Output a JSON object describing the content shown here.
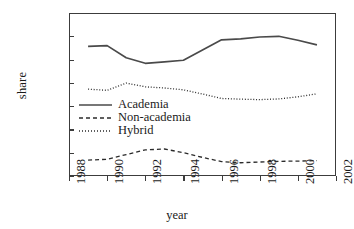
{
  "chart_data": {
    "type": "line",
    "title": "",
    "xlabel": "year",
    "ylabel": "share",
    "xlim": [
      1988,
      2002
    ],
    "ylim": [
      0.0,
      0.7
    ],
    "grid": false,
    "legend_position": "inside-left",
    "xticks": [
      "1988",
      "1990",
      "1992",
      "1994",
      "1996",
      "1998",
      "2000",
      "2002"
    ],
    "xtick_values": [
      1988,
      1990,
      1992,
      1994,
      1996,
      1998,
      2000,
      2002
    ],
    "yticks": [
      "0.000",
      "0.100",
      "0.200",
      "0.300",
      "0.400",
      "0.500",
      "0.600",
      "0.700"
    ],
    "ytick_values": [
      0.0,
      0.1,
      0.2,
      0.3,
      0.4,
      0.5,
      0.6,
      0.7
    ],
    "x": [
      1989,
      1990,
      1991,
      1992,
      1993,
      1994,
      1995,
      1996,
      1997,
      1998,
      1999,
      2000,
      2001
    ],
    "series": [
      {
        "name": "Academia",
        "style": "solid",
        "color": "#4a4a4a",
        "values": [
          0.557,
          0.56,
          0.508,
          0.484,
          0.49,
          0.497,
          0.541,
          0.585,
          0.589,
          0.597,
          0.6,
          0.583,
          0.563
        ]
      },
      {
        "name": "Non-academia",
        "style": "dashed",
        "color": "#2b2b2b",
        "values": [
          0.068,
          0.072,
          0.092,
          0.112,
          0.116,
          0.1,
          0.08,
          0.062,
          0.057,
          0.06,
          0.063,
          0.064,
          0.066
        ]
      },
      {
        "name": "Hybrid",
        "style": "dotted",
        "color": "#2b2b2b",
        "values": [
          0.373,
          0.368,
          0.399,
          0.383,
          0.378,
          0.37,
          0.352,
          0.333,
          0.33,
          0.328,
          0.331,
          0.34,
          0.353
        ]
      }
    ]
  },
  "legend": {
    "items": [
      {
        "label": "Academia"
      },
      {
        "label": "Non-academia"
      },
      {
        "label": "Hybrid"
      }
    ]
  }
}
